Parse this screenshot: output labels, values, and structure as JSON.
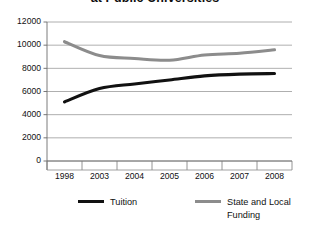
{
  "chart_data": {
    "type": "line",
    "title": "at Public Universities",
    "xlabel": "",
    "ylabel": "",
    "categories": [
      "1998",
      "2003",
      "2004",
      "2005",
      "2006",
      "2007",
      "2008"
    ],
    "ylim": [
      0,
      12000
    ],
    "ytick_values": [
      0,
      2000,
      4000,
      6000,
      8000,
      10000,
      12000
    ],
    "ytick_labels": [
      "0",
      "2000",
      "4000",
      "6000",
      "8000",
      "10000",
      "12000"
    ],
    "grid": true,
    "legend_position": "bottom",
    "series": [
      {
        "name": "Tuition",
        "color": "#111111",
        "values": [
          5100,
          6250,
          6650,
          7000,
          7350,
          7500,
          7550
        ]
      },
      {
        "name": "State and Local Funding",
        "color": "#8c8c8c",
        "values": [
          10300,
          9100,
          8850,
          8700,
          9150,
          9300,
          9600
        ]
      }
    ]
  },
  "legend": {
    "tuition_label": "Tuition",
    "funding_label": "State and Local Funding"
  }
}
